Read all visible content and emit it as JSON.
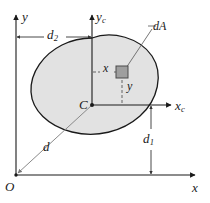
{
  "figure": {
    "colors": {
      "line": "#1a1a1a",
      "thin_line": "#555555",
      "blob_fill": "#e2e2e2",
      "blob_stroke": "#1a1a1a",
      "element_fill": "#9e9e9e",
      "element_stroke": "#4a4a4a",
      "background": "#ffffff"
    },
    "axes": {
      "y_label": "y",
      "x_label": "x",
      "origin_label": "O",
      "yc_label": "y",
      "yc_sub": "c",
      "xc_label": "x",
      "xc_sub": "c"
    },
    "points": {
      "centroid_label": "C"
    },
    "dimensions": {
      "d2_label": "d",
      "d2_sub": "2",
      "d1_label": "d",
      "d1_sub": "1",
      "d_label": "d"
    },
    "element": {
      "callout_label": "dA",
      "x_label": "x",
      "y_label": "y"
    }
  }
}
